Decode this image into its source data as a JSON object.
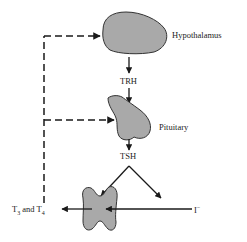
{
  "diagram": {
    "nodes": {
      "hypothalamus": {
        "label": "Hypothalamus",
        "fill": "#a9a9a9",
        "stroke": "#333333"
      },
      "pituitary": {
        "label": "Pituitary",
        "fill": "#a9a9a9",
        "stroke": "#333333"
      },
      "thyroid": {
        "label": "",
        "fill": "#a9a9a9",
        "stroke": "#333333"
      }
    },
    "signals": {
      "trh": "TRH",
      "tsh": "TSH",
      "output": {
        "t_prefix": "T",
        "sub1": "3",
        "and": " and T",
        "sub2": "4"
      },
      "input": {
        "base": "I",
        "sup": "−"
      }
    },
    "edges": [
      {
        "from": "hypothalamus",
        "to": "pituitary",
        "label": "TRH",
        "style": "solid"
      },
      {
        "from": "pituitary",
        "to": "thyroid",
        "label": "TSH",
        "style": "solid"
      },
      {
        "from": "iodide",
        "to": "thyroid",
        "label": "I−",
        "style": "solid"
      },
      {
        "from": "thyroid",
        "to": "output",
        "label": "T3 and T4",
        "style": "solid"
      },
      {
        "from": "output",
        "to": "hypothalamus",
        "style": "dashed",
        "type": "negative-feedback"
      },
      {
        "from": "output",
        "to": "pituitary",
        "style": "dashed",
        "type": "negative-feedback"
      }
    ],
    "colors": {
      "line": "#1a1a1a",
      "organ_fill": "#a9a9a9"
    }
  }
}
